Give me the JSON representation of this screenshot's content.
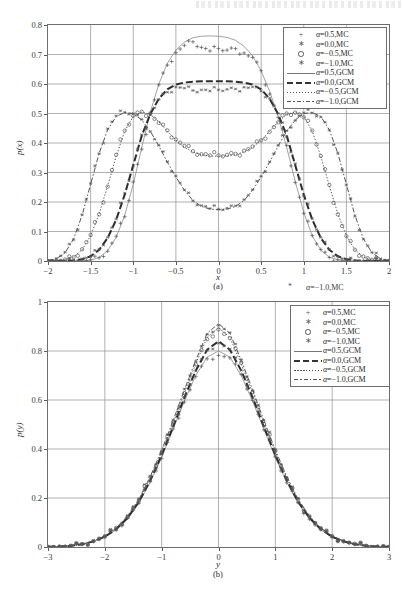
{
  "figure": {
    "panels": [
      "a",
      "b"
    ],
    "stray_artifact": {
      "label": "α=−1.0,MC",
      "marker": "asterisk-marker"
    }
  },
  "chart_data": [
    {
      "id": "panel-a",
      "type": "line",
      "title": "",
      "caption": "(a)",
      "xlabel": "x",
      "ylabel": "p(x)",
      "xlim": [
        -2,
        2
      ],
      "ylim": [
        0,
        0.8
      ],
      "xticks": [
        -2,
        -1.5,
        -1,
        -0.5,
        0,
        0.5,
        1,
        1.5,
        2
      ],
      "xtick_labels": [
        "−2",
        "−1.5",
        "−1",
        "−0.5",
        "0",
        "0.5",
        "1",
        "1.5",
        "2"
      ],
      "yticks": [
        0,
        0.1,
        0.2,
        0.3,
        0.4,
        0.5,
        0.6,
        0.7,
        0.8
      ],
      "ytick_labels": [
        "0",
        "0.1",
        "0.2",
        "0.3",
        "0.4",
        "0.5",
        "0.6",
        "0.7",
        "0.8"
      ],
      "grid": true,
      "legend_position": "upper-right",
      "x": [
        -2,
        -1.9,
        -1.8,
        -1.7,
        -1.6,
        -1.5,
        -1.4,
        -1.3,
        -1.2,
        -1.1,
        -1,
        -0.9,
        -0.8,
        -0.7,
        -0.6,
        -0.5,
        -0.4,
        -0.3,
        -0.2,
        -0.1,
        0,
        0.1,
        0.2,
        0.3,
        0.4,
        0.5,
        0.6,
        0.7,
        0.8,
        0.9,
        1,
        1.1,
        1.2,
        1.3,
        1.4,
        1.5,
        1.6,
        1.7,
        1.8,
        1.9,
        2
      ],
      "series": [
        {
          "name": "α=0.5,GCM",
          "style": "solid",
          "values": [
            0,
            0,
            0,
            0,
            0,
            0.003,
            0.012,
            0.035,
            0.08,
            0.155,
            0.26,
            0.385,
            0.505,
            0.6,
            0.67,
            0.715,
            0.742,
            0.757,
            0.762,
            0.763,
            0.762,
            0.758,
            0.748,
            0.728,
            0.695,
            0.645,
            0.575,
            0.49,
            0.385,
            0.27,
            0.165,
            0.085,
            0.037,
            0.013,
            0.004,
            0.001,
            0,
            0,
            0,
            0,
            0
          ]
        },
        {
          "name": "α=0.0,GCM",
          "style": "dashed",
          "values": [
            0,
            0,
            0,
            0.002,
            0.006,
            0.016,
            0.038,
            0.078,
            0.14,
            0.225,
            0.325,
            0.425,
            0.498,
            0.55,
            0.582,
            0.598,
            0.605,
            0.608,
            0.609,
            0.609,
            0.609,
            0.609,
            0.608,
            0.605,
            0.598,
            0.582,
            0.55,
            0.498,
            0.425,
            0.325,
            0.225,
            0.14,
            0.078,
            0.038,
            0.016,
            0.006,
            0.002,
            0,
            0,
            0,
            0
          ]
        },
        {
          "name": "α=−0.5,GCM",
          "style": "dotted",
          "values": [
            0,
            0.001,
            0.004,
            0.014,
            0.038,
            0.085,
            0.16,
            0.255,
            0.355,
            0.44,
            0.49,
            0.505,
            0.497,
            0.472,
            0.44,
            0.41,
            0.385,
            0.37,
            0.36,
            0.356,
            0.355,
            0.356,
            0.36,
            0.37,
            0.385,
            0.41,
            0.44,
            0.472,
            0.497,
            0.505,
            0.49,
            0.44,
            0.355,
            0.255,
            0.16,
            0.085,
            0.038,
            0.014,
            0.004,
            0.001,
            0
          ]
        },
        {
          "name": "α=−1.0,GCM",
          "style": "dashdot",
          "values": [
            0.002,
            0.008,
            0.028,
            0.075,
            0.155,
            0.26,
            0.365,
            0.445,
            0.49,
            0.503,
            0.5,
            0.478,
            0.44,
            0.39,
            0.335,
            0.285,
            0.24,
            0.205,
            0.185,
            0.176,
            0.174,
            0.176,
            0.185,
            0.205,
            0.24,
            0.285,
            0.335,
            0.39,
            0.44,
            0.478,
            0.5,
            0.503,
            0.49,
            0.445,
            0.365,
            0.26,
            0.155,
            0.075,
            0.028,
            0.008,
            0.002
          ]
        },
        {
          "name": "α=0.5,MC",
          "style": "plus-marker",
          "values": [
            0,
            0,
            0,
            0,
            0,
            0.004,
            0.011,
            0.033,
            0.084,
            0.15,
            0.268,
            0.379,
            0.5,
            0.597,
            0.664,
            0.706,
            0.731,
            0.743,
            0.724,
            0.712,
            0.72,
            0.715,
            0.72,
            0.705,
            0.69,
            0.645,
            0.566,
            0.486,
            0.392,
            0.266,
            0.162,
            0.086,
            0.039,
            0.012,
            0.004,
            0.001,
            0,
            0,
            0,
            0,
            0
          ]
        },
        {
          "name": "α=0.0,MC",
          "style": "asterisk-marker",
          "values": [
            0,
            0,
            0,
            0.002,
            0.007,
            0.015,
            0.04,
            0.08,
            0.142,
            0.23,
            0.322,
            0.428,
            0.495,
            0.548,
            0.572,
            0.59,
            0.586,
            0.578,
            0.58,
            0.576,
            0.58,
            0.582,
            0.583,
            0.589,
            0.59,
            0.576,
            0.552,
            0.5,
            0.421,
            0.33,
            0.222,
            0.143,
            0.08,
            0.04,
            0.015,
            0.006,
            0.002,
            0,
            0,
            0,
            0
          ]
        },
        {
          "name": "α=−0.5,MC",
          "style": "circle-marker",
          "values": [
            0,
            0.001,
            0.005,
            0.013,
            0.04,
            0.088,
            0.158,
            0.252,
            0.36,
            0.442,
            0.492,
            0.506,
            0.5,
            0.468,
            0.443,
            0.412,
            0.39,
            0.372,
            0.362,
            0.358,
            0.358,
            0.36,
            0.363,
            0.374,
            0.388,
            0.409,
            0.438,
            0.47,
            0.5,
            0.503,
            0.487,
            0.442,
            0.356,
            0.258,
            0.158,
            0.084,
            0.038,
            0.015,
            0.004,
            0.001,
            0
          ]
        },
        {
          "name": "α=−1.0,MC",
          "style": "star-marker",
          "values": [
            0.002,
            0.009,
            0.03,
            0.072,
            0.157,
            0.263,
            0.364,
            0.448,
            0.492,
            0.504,
            0.5,
            0.48,
            0.438,
            0.392,
            0.337,
            0.288,
            0.241,
            0.204,
            0.188,
            0.178,
            0.176,
            0.179,
            0.187,
            0.208,
            0.242,
            0.287,
            0.336,
            0.392,
            0.442,
            0.476,
            0.502,
            0.502,
            0.488,
            0.444,
            0.366,
            0.258,
            0.152,
            0.074,
            0.029,
            0.008,
            0.002
          ]
        }
      ]
    },
    {
      "id": "panel-b",
      "type": "line",
      "title": "",
      "caption": "(b)",
      "xlabel": "y",
      "ylabel": "p(y)",
      "xlim": [
        -3,
        3
      ],
      "ylim": [
        0,
        1
      ],
      "xticks": [
        -3,
        -2,
        -1,
        0,
        1,
        2,
        3
      ],
      "xtick_labels": [
        "−3",
        "−2",
        "−1",
        "0",
        "1",
        "2",
        "3"
      ],
      "yticks": [
        0,
        0.2,
        0.4,
        0.6,
        0.8,
        1
      ],
      "ytick_labels": [
        "0",
        "0.2",
        "0.4",
        "0.6",
        "0.8",
        "1"
      ],
      "grid": true,
      "legend_position": "upper-right",
      "x": [
        -3,
        -2.8,
        -2.6,
        -2.4,
        -2.2,
        -2,
        -1.8,
        -1.6,
        -1.4,
        -1.2,
        -1,
        -0.8,
        -0.6,
        -0.4,
        -0.2,
        0,
        0.2,
        0.4,
        0.6,
        0.8,
        1,
        1.2,
        1.4,
        1.6,
        1.8,
        2,
        2.2,
        2.4,
        2.6,
        2.8,
        3
      ],
      "series": [
        {
          "name": "α=0.5,GCM",
          "style": "solid",
          "values": [
            0.001,
            0.002,
            0.005,
            0.011,
            0.022,
            0.04,
            0.07,
            0.115,
            0.18,
            0.265,
            0.365,
            0.48,
            0.595,
            0.7,
            0.775,
            0.8,
            0.775,
            0.7,
            0.595,
            0.48,
            0.365,
            0.265,
            0.18,
            0.115,
            0.07,
            0.04,
            0.022,
            0.011,
            0.005,
            0.002,
            0.001
          ]
        },
        {
          "name": "α=0.0,GCM",
          "style": "dashed",
          "values": [
            0.001,
            0.002,
            0.005,
            0.011,
            0.023,
            0.042,
            0.073,
            0.119,
            0.185,
            0.272,
            0.375,
            0.49,
            0.61,
            0.72,
            0.805,
            0.84,
            0.805,
            0.72,
            0.61,
            0.49,
            0.375,
            0.272,
            0.185,
            0.119,
            0.073,
            0.042,
            0.023,
            0.011,
            0.005,
            0.002,
            0.001
          ]
        },
        {
          "name": "α=−0.5,GCM",
          "style": "dotted",
          "values": [
            0.001,
            0.002,
            0.005,
            0.012,
            0.024,
            0.044,
            0.076,
            0.124,
            0.192,
            0.282,
            0.388,
            0.505,
            0.63,
            0.748,
            0.855,
            0.895,
            0.855,
            0.748,
            0.63,
            0.505,
            0.388,
            0.282,
            0.192,
            0.124,
            0.076,
            0.044,
            0.024,
            0.012,
            0.005,
            0.002,
            0.001
          ]
        },
        {
          "name": "α=−1.0,GCM",
          "style": "dashdot",
          "values": [
            0.001,
            0.002,
            0.006,
            0.012,
            0.025,
            0.045,
            0.078,
            0.127,
            0.196,
            0.288,
            0.396,
            0.515,
            0.642,
            0.762,
            0.872,
            0.912,
            0.872,
            0.762,
            0.642,
            0.515,
            0.396,
            0.288,
            0.196,
            0.127,
            0.078,
            0.045,
            0.025,
            0.012,
            0.006,
            0.002,
            0.001
          ]
        },
        {
          "name": "α=0.5,MC",
          "style": "plus-marker",
          "values": [
            0.001,
            0.002,
            0.005,
            0.011,
            0.022,
            0.041,
            0.069,
            0.118,
            0.178,
            0.268,
            0.362,
            0.482,
            0.592,
            0.695,
            0.768,
            0.782,
            0.772,
            0.705,
            0.598,
            0.478,
            0.368,
            0.262,
            0.182,
            0.113,
            0.071,
            0.039,
            0.023,
            0.01,
            0.005,
            0.002,
            0.001
          ]
        },
        {
          "name": "α=0.0,MC",
          "style": "asterisk-marker",
          "values": [
            0.001,
            0.002,
            0.005,
            0.012,
            0.023,
            0.043,
            0.072,
            0.12,
            0.188,
            0.27,
            0.378,
            0.492,
            0.612,
            0.718,
            0.802,
            0.832,
            0.808,
            0.722,
            0.608,
            0.492,
            0.372,
            0.275,
            0.182,
            0.121,
            0.074,
            0.041,
            0.024,
            0.012,
            0.005,
            0.002,
            0.001
          ]
        },
        {
          "name": "α=−0.5,MC",
          "style": "circle-marker",
          "values": [
            0.001,
            0.002,
            0.005,
            0.012,
            0.025,
            0.043,
            0.078,
            0.122,
            0.19,
            0.285,
            0.385,
            0.508,
            0.628,
            0.745,
            0.848,
            0.888,
            0.852,
            0.752,
            0.632,
            0.502,
            0.392,
            0.278,
            0.195,
            0.125,
            0.075,
            0.045,
            0.023,
            0.013,
            0.005,
            0.002,
            0.001
          ]
        },
        {
          "name": "α=−1.0,MC",
          "style": "star-marker",
          "values": [
            0.001,
            0.002,
            0.006,
            0.013,
            0.025,
            0.046,
            0.077,
            0.129,
            0.198,
            0.29,
            0.392,
            0.518,
            0.645,
            0.758,
            0.868,
            0.905,
            0.875,
            0.765,
            0.638,
            0.518,
            0.398,
            0.285,
            0.198,
            0.125,
            0.08,
            0.044,
            0.026,
            0.012,
            0.006,
            0.002,
            0.001
          ]
        }
      ]
    }
  ]
}
